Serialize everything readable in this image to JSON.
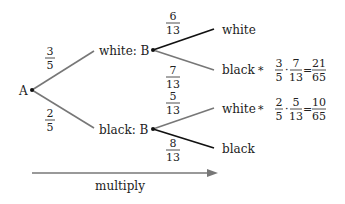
{
  "root": {
    "label": "A"
  },
  "level1": [
    {
      "label": "white: B",
      "prob": {
        "num": "3",
        "den": "5"
      }
    },
    {
      "label": "black: B",
      "prob": {
        "num": "2",
        "den": "5"
      }
    }
  ],
  "level2": [
    {
      "label": "white",
      "prob": {
        "num": "6",
        "den": "13"
      },
      "parent": 0,
      "highlight": true
    },
    {
      "label": "black",
      "prob": {
        "num": "7",
        "den": "13"
      },
      "parent": 0,
      "highlight": false,
      "marker": "*",
      "calc": {
        "a": {
          "num": "3",
          "den": "5"
        },
        "op": "·",
        "b": {
          "num": "7",
          "den": "13"
        },
        "eq": "=",
        "r": {
          "num": "21",
          "den": "65"
        }
      }
    },
    {
      "label": "white",
      "prob": {
        "num": "5",
        "den": "13"
      },
      "parent": 1,
      "highlight": false,
      "marker": "*",
      "calc": {
        "a": {
          "num": "2",
          "den": "5"
        },
        "op": "·",
        "b": {
          "num": "5",
          "den": "13"
        },
        "eq": "=",
        "r": {
          "num": "10",
          "den": "65"
        }
      }
    },
    {
      "label": "black",
      "prob": {
        "num": "8",
        "den": "13"
      },
      "parent": 1,
      "highlight": true
    }
  ],
  "arrow": {
    "label": "multiply"
  },
  "colors": {
    "gray_line": "#777777",
    "dark_line": "#111111",
    "text": "#222222"
  }
}
